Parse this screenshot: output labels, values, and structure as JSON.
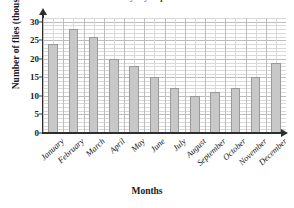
{
  "chart_data": {
    "type": "bar",
    "title": "Monthly Fly Population",
    "xlabel": "Months",
    "ylabel": "Number of flies (thousands)",
    "categories": [
      "January",
      "February",
      "March",
      "April",
      "May",
      "June",
      "July",
      "August",
      "September",
      "October",
      "November",
      "December"
    ],
    "values": [
      24,
      28,
      26,
      20,
      18,
      15,
      12,
      10,
      11,
      12,
      15,
      19
    ],
    "ylim": [
      0,
      31
    ],
    "ytick_labels": [
      "0",
      "5",
      "10",
      "15",
      "20",
      "25",
      "30"
    ],
    "ytick_values": [
      0,
      5,
      10,
      15,
      20,
      25,
      30
    ],
    "minor_grid_step": 1,
    "grid": true,
    "legend": false,
    "bar_fill_color": "#c8c8c8",
    "bar_edge_color": "#9a9a9a",
    "axis_color": "#2e2e2e",
    "grid_color": "#d9d9d9"
  }
}
